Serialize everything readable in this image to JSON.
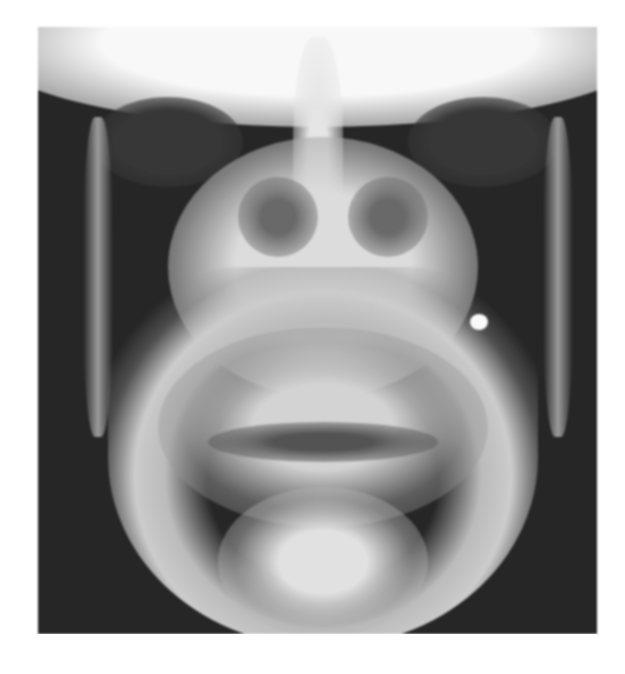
{
  "figure": {
    "type": "radiograph",
    "view": "posteroanterior skull / mandible",
    "background_color": "#ffffff",
    "image_dark_tone": "#2a2a2a",
    "image_bright_tone": "#efefef",
    "caption": ""
  }
}
